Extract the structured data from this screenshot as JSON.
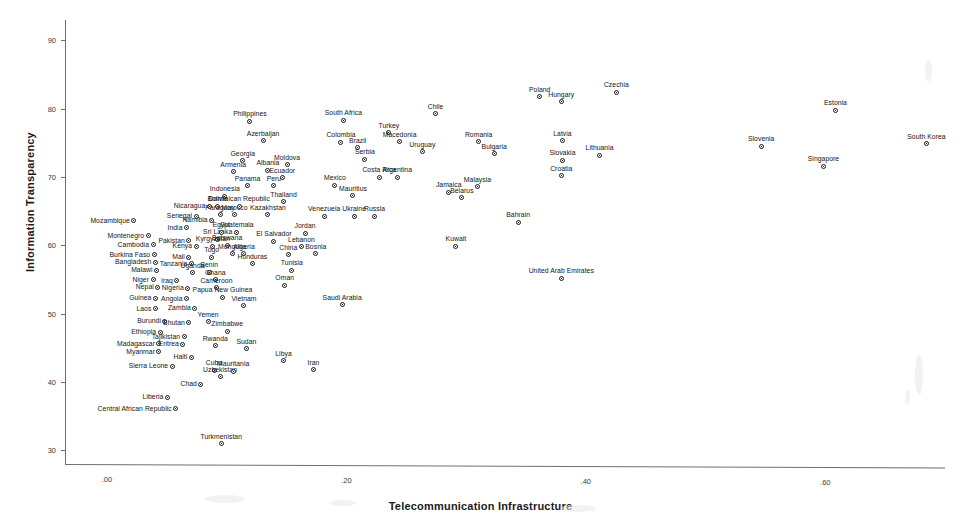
{
  "chart_data": {
    "type": "scatter",
    "title": "",
    "xlabel": "Telecommunication Infrastructure",
    "ylabel": "Information Transparency",
    "xlim": [
      -0.035,
      0.7
    ],
    "ylim": [
      28.0,
      93.0
    ],
    "xticks": [
      0.0,
      0.2,
      0.4,
      0.6
    ],
    "xticklabels": [
      ".00",
      ".20",
      ".40",
      ".60"
    ],
    "yticks": [
      30,
      40,
      50,
      60,
      70,
      80,
      90
    ],
    "yticklabels": [
      "30",
      "40",
      "50",
      "60",
      "70",
      "80",
      "90"
    ],
    "grid": false,
    "legend": false,
    "point_color": "#1a1a1a",
    "axis_color": "#6f6f6f",
    "points": [
      {
        "label": "Mozambique",
        "x": 0.0225,
        "y": 63.6,
        "lpos": "r"
      },
      {
        "label": "Montenegro",
        "x": 0.0345,
        "y": 61.4,
        "lpos": "r"
      },
      {
        "label": "Cambodia",
        "x": 0.0385,
        "y": 60.1,
        "lpos": "r"
      },
      {
        "label": "Burkina Faso",
        "x": 0.0395,
        "y": 58.6,
        "lpos": "r"
      },
      {
        "label": "Bangladesh",
        "x": 0.0405,
        "y": 57.5,
        "lpos": "r"
      },
      {
        "label": "Malawi",
        "x": 0.0415,
        "y": 56.4,
        "lpos": "r"
      },
      {
        "label": "Niger",
        "x": 0.0385,
        "y": 55.0,
        "lpos": "r"
      },
      {
        "label": "Nepal",
        "x": 0.0425,
        "y": 53.9,
        "lpos": "r"
      },
      {
        "label": "Guinea",
        "x": 0.0405,
        "y": 52.3,
        "lpos": "r"
      },
      {
        "label": "Laos",
        "x": 0.0405,
        "y": 50.7,
        "lpos": "r"
      },
      {
        "label": "Burundi",
        "x": 0.0485,
        "y": 48.9,
        "lpos": "r"
      },
      {
        "label": "Ethiopia",
        "x": 0.0445,
        "y": 47.3,
        "lpos": "r"
      },
      {
        "label": "Madagascar",
        "x": 0.0435,
        "y": 45.6,
        "lpos": "r"
      },
      {
        "label": "Myanmar",
        "x": 0.0435,
        "y": 44.4,
        "lpos": "r"
      },
      {
        "label": "Sierra Leone",
        "x": 0.0545,
        "y": 42.3,
        "lpos": "r"
      },
      {
        "label": "Liberia",
        "x": 0.0505,
        "y": 37.8,
        "lpos": "r"
      },
      {
        "label": "Central African Republic",
        "x": 0.0575,
        "y": 36.1,
        "lpos": "r"
      },
      {
        "label": "Senegal",
        "x": 0.0745,
        "y": 64.3,
        "lpos": "r"
      },
      {
        "label": "India",
        "x": 0.0665,
        "y": 62.6,
        "lpos": "r"
      },
      {
        "label": "Pakistan",
        "x": 0.0685,
        "y": 60.7,
        "lpos": "r"
      },
      {
        "label": "Kenya",
        "x": 0.0745,
        "y": 59.9,
        "lpos": "r"
      },
      {
        "label": "Mali",
        "x": 0.0685,
        "y": 58.3,
        "lpos": "r"
      },
      {
        "label": "Tanzania",
        "x": 0.0705,
        "y": 57.3,
        "lpos": "r"
      },
      {
        "label": "Uganda",
        "x": 0.0715,
        "y": 56.0,
        "lpos": "c"
      },
      {
        "label": "Iraq",
        "x": 0.0585,
        "y": 54.8,
        "lpos": "r"
      },
      {
        "label": "Nigeria",
        "x": 0.0675,
        "y": 53.7,
        "lpos": "r"
      },
      {
        "label": "Angola",
        "x": 0.0665,
        "y": 52.2,
        "lpos": "r"
      },
      {
        "label": "Zambia",
        "x": 0.0735,
        "y": 50.8,
        "lpos": "r"
      },
      {
        "label": "Bhutan",
        "x": 0.0685,
        "y": 48.7,
        "lpos": "r"
      },
      {
        "label": "Tajikistan",
        "x": 0.0645,
        "y": 46.6,
        "lpos": "r"
      },
      {
        "label": "Eritrea",
        "x": 0.0635,
        "y": 45.5,
        "lpos": "r"
      },
      {
        "label": "Haiti",
        "x": 0.0705,
        "y": 43.6,
        "lpos": "r"
      },
      {
        "label": "Chad",
        "x": 0.0785,
        "y": 39.7,
        "lpos": "r"
      },
      {
        "label": "Yemen",
        "x": 0.0845,
        "y": 48.8,
        "lpos": "c"
      },
      {
        "label": "Rwanda",
        "x": 0.0905,
        "y": 45.3,
        "lpos": "c"
      },
      {
        "label": "Cuba",
        "x": 0.0895,
        "y": 41.7,
        "lpos": "c"
      },
      {
        "label": "Uzbekistan",
        "x": 0.0945,
        "y": 40.8,
        "lpos": "c"
      },
      {
        "label": "Turkmenistan",
        "x": 0.0955,
        "y": 31.0,
        "lpos": "c"
      },
      {
        "label": "Zimbabwe",
        "x": 0.1005,
        "y": 47.4,
        "lpos": "c"
      },
      {
        "label": "Sudan",
        "x": 0.1165,
        "y": 44.9,
        "lpos": "c"
      },
      {
        "label": "Mauritania",
        "x": 0.1055,
        "y": 41.6,
        "lpos": "c"
      },
      {
        "label": "Nicaragua",
        "x": 0.0855,
        "y": 65.7,
        "lpos": "r"
      },
      {
        "label": "Namibia",
        "x": 0.0875,
        "y": 63.7,
        "lpos": "r"
      },
      {
        "label": "Sri Lanka",
        "x": 0.0925,
        "y": 60.9,
        "lpos": "c"
      },
      {
        "label": "Kyrgyzstan",
        "x": 0.0885,
        "y": 59.9,
        "lpos": "c"
      },
      {
        "label": "Togo",
        "x": 0.0875,
        "y": 58.3,
        "lpos": "c"
      },
      {
        "label": "Benin",
        "x": 0.0855,
        "y": 56.1,
        "lpos": "c"
      },
      {
        "label": "Ghana",
        "x": 0.0905,
        "y": 55.0,
        "lpos": "c"
      },
      {
        "label": "Cameroon",
        "x": 0.0915,
        "y": 53.8,
        "lpos": "c"
      },
      {
        "label": "Papua New Guinea",
        "x": 0.0965,
        "y": 52.4,
        "lpos": "c"
      },
      {
        "label": "Indonesia",
        "x": 0.0985,
        "y": 67.2,
        "lpos": "c"
      },
      {
        "label": "Bolivia",
        "x": 0.0925,
        "y": 65.7,
        "lpos": "c"
      },
      {
        "label": "Paraguay",
        "x": 0.0945,
        "y": 64.5,
        "lpos": "c"
      },
      {
        "label": "Morocco",
        "x": 0.1065,
        "y": 64.5,
        "lpos": "c"
      },
      {
        "label": "Egypt",
        "x": 0.0955,
        "y": 61.9,
        "lpos": "c"
      },
      {
        "label": "Guatemala",
        "x": 0.1085,
        "y": 61.9,
        "lpos": "c"
      },
      {
        "label": "Botswana",
        "x": 0.1005,
        "y": 60.0,
        "lpos": "c"
      },
      {
        "label": "Mongolia",
        "x": 0.1045,
        "y": 58.8,
        "lpos": "c"
      },
      {
        "label": "Algeria",
        "x": 0.1145,
        "y": 58.8,
        "lpos": "c"
      },
      {
        "label": "Honduras",
        "x": 0.1215,
        "y": 57.3,
        "lpos": "c"
      },
      {
        "label": "Dominican Republic",
        "x": 0.1105,
        "y": 65.7,
        "lpos": "c"
      },
      {
        "label": "Armenia",
        "x": 0.1055,
        "y": 70.8,
        "lpos": "c"
      },
      {
        "label": "Georgia",
        "x": 0.1135,
        "y": 72.4,
        "lpos": "c"
      },
      {
        "label": "Panama",
        "x": 0.1175,
        "y": 68.7,
        "lpos": "c"
      },
      {
        "label": "Albania",
        "x": 0.1345,
        "y": 71.0,
        "lpos": "c"
      },
      {
        "label": "Peru",
        "x": 0.1395,
        "y": 68.7,
        "lpos": "c"
      },
      {
        "label": "Kazakhstan",
        "x": 0.1345,
        "y": 64.5,
        "lpos": "c"
      },
      {
        "label": "El Salvador",
        "x": 0.1395,
        "y": 60.6,
        "lpos": "c"
      },
      {
        "label": "Philippines",
        "x": 0.1195,
        "y": 78.2,
        "lpos": "c"
      },
      {
        "label": "Azerbaijan",
        "x": 0.1305,
        "y": 75.3,
        "lpos": "c"
      },
      {
        "label": "Moldova",
        "x": 0.1505,
        "y": 71.8,
        "lpos": "c"
      },
      {
        "label": "Ecuador",
        "x": 0.1465,
        "y": 69.9,
        "lpos": "c"
      },
      {
        "label": "Thailand",
        "x": 0.1475,
        "y": 66.4,
        "lpos": "c"
      },
      {
        "label": "Vietnam",
        "x": 0.1145,
        "y": 51.2,
        "lpos": "c"
      },
      {
        "label": "Libya",
        "x": 0.1475,
        "y": 43.1,
        "lpos": "c"
      },
      {
        "label": "Iran",
        "x": 0.1725,
        "y": 41.8,
        "lpos": "c"
      },
      {
        "label": "Oman",
        "x": 0.1485,
        "y": 54.2,
        "lpos": "c"
      },
      {
        "label": "Tunisia",
        "x": 0.1545,
        "y": 56.4,
        "lpos": "c"
      },
      {
        "label": "China",
        "x": 0.1515,
        "y": 58.6,
        "lpos": "c"
      },
      {
        "label": "Lebanon",
        "x": 0.1625,
        "y": 59.8,
        "lpos": "c"
      },
      {
        "label": "Jordan",
        "x": 0.1655,
        "y": 61.8,
        "lpos": "c"
      },
      {
        "label": "Bosnia",
        "x": 0.1745,
        "y": 58.8,
        "lpos": "c"
      },
      {
        "label": "Saudi Arabia",
        "x": 0.1965,
        "y": 51.3,
        "lpos": "c"
      },
      {
        "label": "Venezuela",
        "x": 0.1815,
        "y": 64.3,
        "lpos": "c"
      },
      {
        "label": "Ukraine",
        "x": 0.2065,
        "y": 64.3,
        "lpos": "c"
      },
      {
        "label": "Russia",
        "x": 0.2235,
        "y": 64.3,
        "lpos": "c"
      },
      {
        "label": "Mexico",
        "x": 0.1905,
        "y": 68.8,
        "lpos": "c"
      },
      {
        "label": "Mauritius",
        "x": 0.2055,
        "y": 67.3,
        "lpos": "c"
      },
      {
        "label": "Colombia",
        "x": 0.1955,
        "y": 75.1,
        "lpos": "c"
      },
      {
        "label": "Brazil",
        "x": 0.2095,
        "y": 74.3,
        "lpos": "c"
      },
      {
        "label": "South Africa",
        "x": 0.1975,
        "y": 78.3,
        "lpos": "c"
      },
      {
        "label": "Serbia",
        "x": 0.2155,
        "y": 72.6,
        "lpos": "c"
      },
      {
        "label": "Costa Rica",
        "x": 0.2275,
        "y": 70.0,
        "lpos": "c"
      },
      {
        "label": "Argentina",
        "x": 0.2425,
        "y": 70.0,
        "lpos": "c"
      },
      {
        "label": "Turkey",
        "x": 0.2355,
        "y": 76.5,
        "lpos": "c"
      },
      {
        "label": "Macedonia",
        "x": 0.2445,
        "y": 75.2,
        "lpos": "c"
      },
      {
        "label": "Uruguay",
        "x": 0.2635,
        "y": 73.7,
        "lpos": "c"
      },
      {
        "label": "Chile",
        "x": 0.2745,
        "y": 79.3,
        "lpos": "c"
      },
      {
        "label": "Jamaica",
        "x": 0.2855,
        "y": 67.8,
        "lpos": "c"
      },
      {
        "label": "Belarus",
        "x": 0.2965,
        "y": 67.0,
        "lpos": "c"
      },
      {
        "label": "Malaysia",
        "x": 0.3095,
        "y": 68.6,
        "lpos": "c"
      },
      {
        "label": "Romania",
        "x": 0.3105,
        "y": 75.2,
        "lpos": "c"
      },
      {
        "label": "Bulgaria",
        "x": 0.3235,
        "y": 73.4,
        "lpos": "c"
      },
      {
        "label": "Kuwait",
        "x": 0.2915,
        "y": 59.9,
        "lpos": "c"
      },
      {
        "label": "Bahrain",
        "x": 0.3435,
        "y": 63.4,
        "lpos": "c"
      },
      {
        "label": "United Arab Emirates",
        "x": 0.3795,
        "y": 55.2,
        "lpos": "c"
      },
      {
        "label": "Poland",
        "x": 0.3615,
        "y": 81.8,
        "lpos": "c"
      },
      {
        "label": "Hungary",
        "x": 0.3795,
        "y": 81.0,
        "lpos": "c"
      },
      {
        "label": "Czechia",
        "x": 0.4255,
        "y": 82.4,
        "lpos": "c"
      },
      {
        "label": "Latvia",
        "x": 0.3805,
        "y": 75.3,
        "lpos": "c"
      },
      {
        "label": "Slovakia",
        "x": 0.3805,
        "y": 72.5,
        "lpos": "c"
      },
      {
        "label": "Lithuania",
        "x": 0.4115,
        "y": 73.2,
        "lpos": "c"
      },
      {
        "label": "Croatia",
        "x": 0.3795,
        "y": 70.2,
        "lpos": "c"
      },
      {
        "label": "Slovenia",
        "x": 0.5465,
        "y": 74.5,
        "lpos": "c"
      },
      {
        "label": "Estonia",
        "x": 0.6085,
        "y": 79.8,
        "lpos": "c"
      },
      {
        "label": "Singapore",
        "x": 0.5985,
        "y": 71.6,
        "lpos": "c"
      },
      {
        "label": "South Korea",
        "x": 0.6845,
        "y": 74.9,
        "lpos": "c"
      }
    ]
  },
  "axis": {
    "x_title": "Telecommunication Infrastructure",
    "y_title": "Information Transparency",
    "x_labels": [
      ".00",
      ".20",
      ".40",
      ".60"
    ],
    "y_labels": [
      "90",
      "80",
      "70",
      "60",
      "50",
      "40",
      "30"
    ]
  }
}
